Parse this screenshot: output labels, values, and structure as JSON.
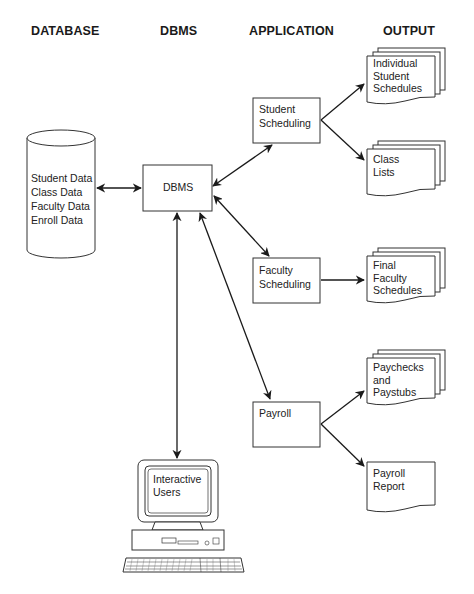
{
  "headers": {
    "database": "DATABASE",
    "dbms": "DBMS",
    "application": "APPLICATION",
    "output": "OUTPUT"
  },
  "database": {
    "shape": "cylinder",
    "lines": [
      "Student Data",
      "Class Data",
      "Faculty Data",
      "Enroll Data"
    ]
  },
  "dbms": {
    "label": "DBMS"
  },
  "applications": [
    {
      "id": "student-scheduling",
      "lines": [
        "Student",
        "Scheduling"
      ]
    },
    {
      "id": "faculty-scheduling",
      "lines": [
        "Faculty",
        "Scheduling"
      ]
    },
    {
      "id": "payroll",
      "lines": [
        "Payroll"
      ]
    }
  ],
  "outputs": [
    {
      "id": "individual-student-schedules",
      "lines": [
        "Individual",
        "Student",
        "Schedules"
      ],
      "stacked": true
    },
    {
      "id": "class-lists",
      "lines": [
        "Class",
        "Lists"
      ],
      "stacked": true
    },
    {
      "id": "final-faculty-schedules",
      "lines": [
        "Final",
        "Faculty",
        "Schedules"
      ],
      "stacked": true
    },
    {
      "id": "paychecks-and-paystubs",
      "lines": [
        "Paychecks",
        "and",
        "Paystubs"
      ],
      "stacked": true
    },
    {
      "id": "payroll-report",
      "lines": [
        "Payroll",
        "Report"
      ],
      "stacked": false
    }
  ],
  "terminal": {
    "lines": [
      "Interactive",
      "Users"
    ]
  },
  "connections": [
    {
      "from": "database",
      "to": "dbms",
      "type": "bidirectional"
    },
    {
      "from": "dbms",
      "to": "student-scheduling",
      "type": "bidirectional"
    },
    {
      "from": "dbms",
      "to": "faculty-scheduling",
      "type": "bidirectional"
    },
    {
      "from": "dbms",
      "to": "payroll",
      "type": "bidirectional"
    },
    {
      "from": "dbms",
      "to": "interactive-users",
      "type": "bidirectional"
    },
    {
      "from": "student-scheduling",
      "to": "individual-student-schedules",
      "type": "directed"
    },
    {
      "from": "student-scheduling",
      "to": "class-lists",
      "type": "directed"
    },
    {
      "from": "faculty-scheduling",
      "to": "final-faculty-schedules",
      "type": "directed"
    },
    {
      "from": "payroll",
      "to": "paychecks-and-paystubs",
      "type": "directed"
    },
    {
      "from": "payroll",
      "to": "payroll-report",
      "type": "directed"
    }
  ]
}
